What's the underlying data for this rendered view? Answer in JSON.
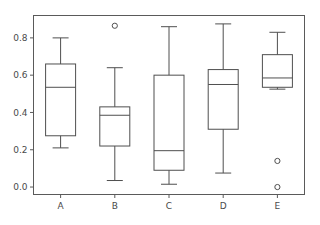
{
  "chart_data": {
    "type": "box",
    "title": "",
    "xlabel": "",
    "ylabel": "",
    "categories": [
      "A",
      "B",
      "C",
      "D",
      "E"
    ],
    "ylim": [
      -0.04,
      0.92
    ],
    "yticks": [
      0.0,
      0.2,
      0.4,
      0.6,
      0.8
    ],
    "ytick_labels": [
      "0.0",
      "0.2",
      "0.4",
      "0.6",
      "0.8"
    ],
    "grid": false,
    "legend": null,
    "boxes": [
      {
        "label": "A",
        "whisker_low": 0.21,
        "q1": 0.275,
        "median": 0.535,
        "q3": 0.66,
        "whisker_high": 0.8,
        "outliers": []
      },
      {
        "label": "B",
        "whisker_low": 0.035,
        "q1": 0.22,
        "median": 0.385,
        "q3": 0.43,
        "whisker_high": 0.64,
        "outliers": [
          0.865
        ]
      },
      {
        "label": "C",
        "whisker_low": 0.015,
        "q1": 0.09,
        "median": 0.195,
        "q3": 0.6,
        "whisker_high": 0.86,
        "outliers": []
      },
      {
        "label": "D",
        "whisker_low": 0.075,
        "q1": 0.31,
        "median": 0.55,
        "q3": 0.63,
        "whisker_high": 0.875,
        "outliers": []
      },
      {
        "label": "E",
        "whisker_low": 0.525,
        "q1": 0.535,
        "median": 0.585,
        "q3": 0.71,
        "whisker_high": 0.83,
        "outliers": [
          0.14,
          0.0
        ]
      }
    ],
    "colors": {
      "line": "#4f4f4f",
      "axis": "#5a5a5a",
      "text": "#4a4a4a",
      "background": "#ffffff"
    }
  }
}
